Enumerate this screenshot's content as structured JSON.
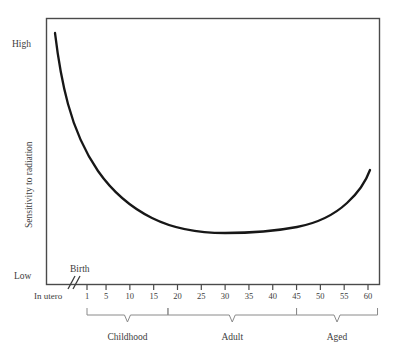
{
  "chart_data": {
    "type": "line",
    "title": "",
    "xlabel": "",
    "ylabel": "Sensitivity to radiation",
    "y_axis_labels": {
      "high": "High",
      "low": "Low"
    },
    "x_pre_axis_labels": {
      "in_utero": "In utero",
      "birth": "Birth"
    },
    "x_tick_labels": [
      "1",
      "5",
      "10",
      "15",
      "20",
      "25",
      "30",
      "35",
      "40",
      "45",
      "50",
      "55",
      "60"
    ],
    "x_tick_values": [
      1,
      5,
      10,
      15,
      20,
      25,
      30,
      35,
      40,
      45,
      50,
      55,
      60
    ],
    "stage_brackets": [
      {
        "label": "Childhood",
        "from": "1",
        "to": "18"
      },
      {
        "label": "Adult",
        "from": "18",
        "to": "45"
      },
      {
        "label": "Aged",
        "from": "45",
        "to": "62"
      }
    ],
    "series": [
      {
        "name": "Sensitivity to radiation",
        "x": [
          "In utero",
          "Birth",
          "1",
          "5",
          "10",
          "15",
          "20",
          "25",
          "30",
          "35",
          "40",
          "45",
          "50",
          "55",
          "60"
        ],
        "values": [
          100,
          88,
          70,
          50,
          36,
          27,
          21,
          17,
          15,
          15,
          15,
          17,
          21,
          30,
          48
        ]
      }
    ],
    "ylim": [
      0,
      100
    ],
    "grid": false,
    "legend": "none",
    "axis_break": true,
    "colors": {
      "curve": "#171717",
      "frame": "#4a4a4a",
      "bracket": "#8a8a8a",
      "text": "#3c3c3c",
      "background": "#ffffff"
    }
  }
}
